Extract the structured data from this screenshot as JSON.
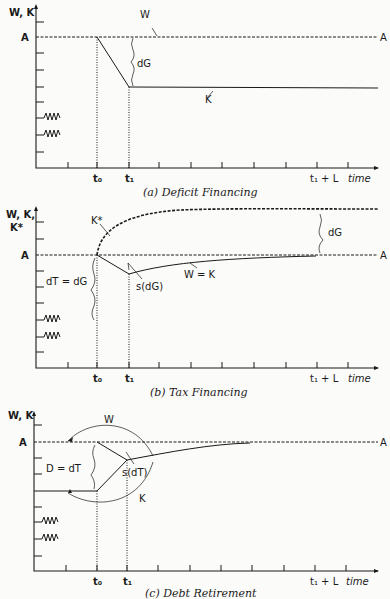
{
  "panels": [
    {
      "id": "a",
      "caption": "(a) Deficit Financing",
      "y_axis_label": "W, K",
      "level_label_left": "A",
      "level_label_right": "A",
      "x_labels": {
        "t0": "t₀",
        "t1": "t₁",
        "t1L": "t₁ + L",
        "time": "time"
      },
      "curve_labels": {
        "W": "W",
        "K": "K",
        "brace": "dG"
      }
    },
    {
      "id": "b",
      "caption": "(b) Tax Financing",
      "y_axis_label_1": "W, K,",
      "y_axis_label_2": "K*",
      "level_label_left": "A",
      "level_label_right": "A",
      "x_labels": {
        "t0": "t₀",
        "t1": "t₁",
        "t1L": "t₁ + L",
        "time": "time"
      },
      "curve_labels": {
        "Kstar": "K*",
        "WK": "W = K",
        "s": "s(dG)",
        "brace_left": "dT = dG",
        "brace_right": "dG"
      }
    },
    {
      "id": "c",
      "caption": "(c) Debt Retirement",
      "y_axis_label": "W, K",
      "level_label_left": "A",
      "level_label_right": "A",
      "x_labels": {
        "t0": "t₀",
        "t1": "t₁",
        "t1L": "t₁ + L",
        "time": "time"
      },
      "curve_labels": {
        "W": "W",
        "K": "K",
        "s": "s(dT)",
        "brace": "D = dT"
      }
    }
  ]
}
